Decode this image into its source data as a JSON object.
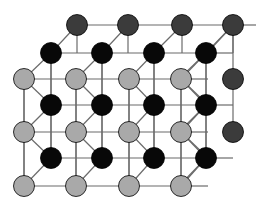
{
  "figure": {
    "title": "Crystal lattice structure diagram",
    "type": "crystal-lattice",
    "background_color": "#ffffff",
    "width": 256,
    "height": 209
  },
  "style": {
    "atom_radius": 10.5,
    "bond_color": "#6b6b6b",
    "bond_width": 1.2,
    "atom_outline_color": "#000000",
    "atom_outline_width": 0.8
  },
  "species": [
    {
      "id": "front-light",
      "label": "light gray atom",
      "color": "#a9a9a9",
      "layer": "front"
    },
    {
      "id": "mid-black",
      "label": "black atom",
      "color": "#080808",
      "layer": "middle"
    },
    {
      "id": "back-dark",
      "label": "dark gray atom",
      "color": "#3b3b3b",
      "layer": "back"
    }
  ],
  "rows": [
    {
      "index": 0,
      "species": "back-dark",
      "y": 25,
      "x_positions": [
        77,
        128,
        182,
        233
      ]
    },
    {
      "index": 1,
      "species": "mid-black",
      "y": 53,
      "x_positions": [
        51,
        102,
        154,
        206
      ]
    },
    {
      "index": 2,
      "species": "front-light",
      "y": 79,
      "x_positions": [
        24,
        76,
        129,
        181
      ]
    },
    {
      "index": 3,
      "species": "mid-black",
      "y": 105,
      "x_positions": [
        51,
        102,
        154,
        206
      ]
    },
    {
      "index": 4,
      "species": "front-light",
      "y": 132,
      "x_positions": [
        24,
        76,
        129,
        181
      ]
    },
    {
      "index": 5,
      "species": "mid-black",
      "y": 158,
      "x_positions": [
        51,
        102,
        154,
        206
      ]
    },
    {
      "index": 6,
      "species": "front-light",
      "y": 186,
      "x_positions": [
        24,
        76,
        129,
        181
      ]
    }
  ],
  "right_edge_atoms": [
    {
      "species": "back-dark",
      "x": 233,
      "y": 79
    },
    {
      "species": "back-dark",
      "x": 233,
      "y": 132
    }
  ],
  "chart_data": {
    "type": "scatter",
    "title": "Crystal lattice structure diagram",
    "xlabel": "",
    "ylabel": "",
    "grid": true,
    "legend": "none",
    "xlim": [
      0,
      256
    ],
    "ylim": [
      0,
      209
    ],
    "series": [
      {
        "name": "light gray atom",
        "color": "#a9a9a9",
        "x": [
          24,
          76,
          129,
          181,
          24,
          76,
          129,
          181,
          24,
          76,
          129,
          181
        ],
        "y": [
          79,
          79,
          79,
          79,
          132,
          132,
          132,
          132,
          186,
          186,
          186,
          186
        ]
      },
      {
        "name": "black atom",
        "color": "#080808",
        "x": [
          51,
          102,
          154,
          206,
          51,
          102,
          154,
          206,
          51,
          102,
          154,
          206
        ],
        "y": [
          53,
          53,
          53,
          53,
          105,
          105,
          105,
          105,
          158,
          158,
          158,
          158
        ]
      },
      {
        "name": "dark gray atom",
        "color": "#3b3b3b",
        "x": [
          77,
          128,
          182,
          233,
          233,
          233
        ],
        "y": [
          25,
          25,
          25,
          25,
          79,
          132
        ]
      }
    ]
  }
}
